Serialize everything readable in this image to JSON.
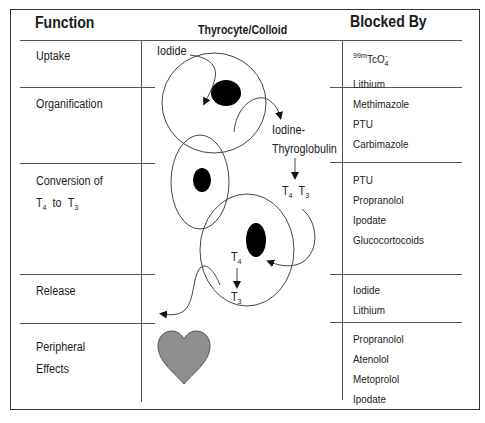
{
  "headers": {
    "function": "Function",
    "cell": "Thyrocyte/Colloid",
    "blocked_by": "Blocked By"
  },
  "rows": [
    {
      "function": "Uptake",
      "blocked_by": [
        "99mTcO4-",
        "Lithium"
      ]
    },
    {
      "function": "Organification",
      "blocked_by": [
        "Methimazole",
        "PTU",
        "Carbimazole"
      ]
    },
    {
      "function": "Conversion of T4 to T3",
      "function_line1": "Conversion of",
      "function_line2_t4": "T",
      "function_line2_t4_sub": "4",
      "function_line2_to": "to",
      "function_line2_t3": "T",
      "function_line2_t3_sub": "3",
      "blocked_by": [
        "PTU",
        "Propranolol",
        "Ipodate",
        "Glucocortocoids"
      ]
    },
    {
      "function": "Release",
      "blocked_by": [
        "Iodide",
        "Lithium"
      ]
    },
    {
      "function": "Peripheral Effects",
      "function_line1": "Peripheral",
      "function_line2": "Effects",
      "blocked_by": [
        "Propranolol",
        "Atenolol",
        "Metoprolol",
        "Ipodate"
      ]
    }
  ],
  "tc": {
    "sup": "99m",
    "base": "TcO",
    "sub": "4",
    "charge": "-"
  },
  "diagram_labels": {
    "iodide": "Iodide",
    "iodine_tg_line1": "Iodine-",
    "iodine_tg_line2": "Thyroglobulin",
    "t4": "T",
    "t4_sub": "4",
    "t3": "T",
    "t3_sub": "3"
  },
  "colors": {
    "line": "#555555",
    "nucleus": "#000000",
    "heart_fill": "#8e8e8e",
    "heart_stroke": "#555555"
  }
}
